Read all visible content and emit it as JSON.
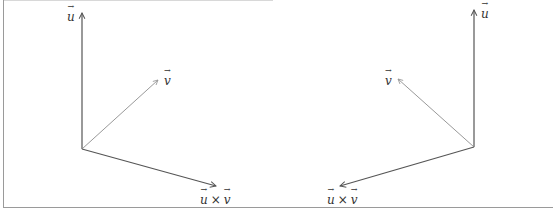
{
  "figures": [
    {
      "id": "left",
      "labels": {
        "u": "u",
        "v": "v",
        "cross_u": "u",
        "cross_op": "×",
        "cross_v": "v"
      },
      "origin": [
        82,
        149
      ],
      "u_tip": [
        82,
        13
      ],
      "v_tip": [
        158,
        80
      ],
      "cross_tip": [
        216,
        186
      ]
    },
    {
      "id": "right",
      "labels": {
        "u": "u",
        "v": "v",
        "cross_u": "u",
        "cross_op": "×",
        "cross_v": "v"
      },
      "origin": [
        474,
        147
      ],
      "u_tip": [
        474,
        10
      ],
      "v_tip": [
        398,
        79
      ],
      "cross_tip": [
        340,
        186
      ]
    }
  ],
  "colors": {
    "axis": "#555555",
    "v_vector": "#999999",
    "frame": "#9a9a9a"
  }
}
